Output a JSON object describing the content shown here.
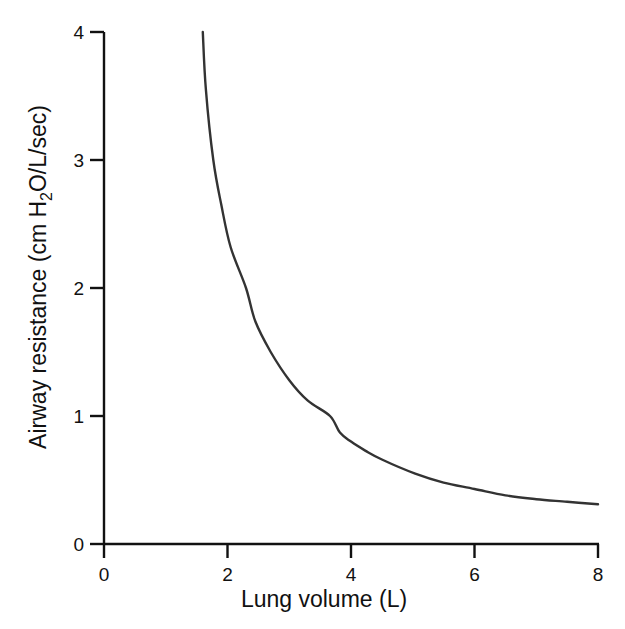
{
  "chart_data": {
    "type": "line",
    "title": "",
    "xlabel": "Lung volume (L)",
    "ylabel_parts": {
      "before": "Airway resistance (cm H",
      "subscript": "2",
      "after": "O/L/sec)"
    },
    "ylabel": "Airway resistance (cm H2O/L/sec)",
    "xlim": [
      0,
      8
    ],
    "ylim": [
      0,
      4
    ],
    "x_ticks": [
      0,
      2,
      4,
      6,
      8
    ],
    "y_ticks": [
      0,
      1,
      2,
      3,
      4
    ],
    "x_tick_labels": [
      "0",
      "2",
      "4",
      "6",
      "8"
    ],
    "y_tick_labels": [
      "0",
      "1",
      "2",
      "3",
      "4"
    ],
    "grid": false,
    "legend": null,
    "series": [
      {
        "name": "Airway resistance vs lung volume",
        "color": "#333333",
        "x": [
          1.6,
          1.65,
          1.77,
          1.9,
          2.05,
          2.3,
          2.45,
          2.7,
          3.0,
          3.3,
          3.66,
          3.82,
          4.0,
          4.23,
          4.5,
          5.04,
          5.5,
          6.0,
          6.5,
          7.0,
          7.5,
          8.0
        ],
        "y": [
          4.0,
          3.55,
          3.0,
          2.65,
          2.32,
          2.0,
          1.74,
          1.5,
          1.28,
          1.12,
          1.0,
          0.87,
          0.8,
          0.73,
          0.66,
          0.55,
          0.48,
          0.43,
          0.38,
          0.35,
          0.33,
          0.31
        ]
      }
    ]
  },
  "colors": {
    "axis": "#111111",
    "curve": "#333333",
    "background": "#ffffff"
  }
}
